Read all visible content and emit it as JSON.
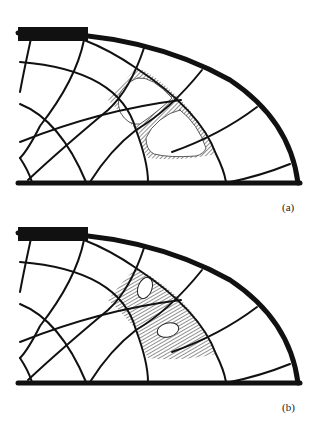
{
  "figure": {
    "panels": [
      {
        "id": "a",
        "label": "(a)",
        "description": "Curved mesh with two adjacent highlighted elements shown as hollow cells with hatched thin walls"
      },
      {
        "id": "b",
        "label": "(b)",
        "description": "Curved mesh with two adjacent hatched elements each containing a small elliptical hole"
      }
    ],
    "colors": {
      "line": "#111111",
      "background": "#ffffff",
      "hatch": "#333333"
    }
  }
}
